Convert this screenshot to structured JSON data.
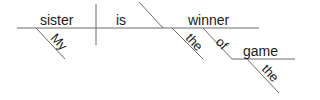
{
  "diagram": {
    "type": "sentence-diagram",
    "sentence": "My sister is winner of the game the",
    "words": {
      "subject": "sister",
      "verb": "is",
      "predicate_noun": "winner",
      "subject_modifier": "My",
      "predicate_modifier": "the",
      "preposition": "of",
      "prep_object": "game",
      "prep_object_modifier": "the"
    },
    "line_color": "#6b6b6b",
    "text_color": "#1a1a1a"
  }
}
